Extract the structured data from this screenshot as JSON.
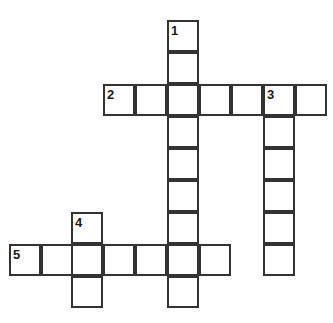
{
  "puzzle": {
    "type": "crossword-grid",
    "title": "",
    "background_color": "#fefefe",
    "cell_fill_color": "#ffffff",
    "line_color": "#333333",
    "number_color": "#1a1a1a",
    "cell_size": 32,
    "border_width": 2,
    "grid_origin": {
      "x": 9,
      "y": 20
    },
    "canvas": {
      "width": 333,
      "height": 323
    },
    "entries": [
      {
        "number": "1",
        "direction": "down",
        "length": 9,
        "start_col": 5,
        "start_row": 0,
        "start_x": 167,
        "start_y": 20
      },
      {
        "number": "2",
        "direction": "across",
        "length": 7,
        "start_col": 3,
        "start_row": 2,
        "start_x": 103,
        "start_y": 84
      },
      {
        "number": "3",
        "direction": "down",
        "length": 6,
        "start_col": 8,
        "start_row": 2,
        "start_x": 263,
        "start_y": 84
      },
      {
        "number": "4",
        "direction": "down",
        "length": 3,
        "start_col": 2,
        "start_row": 6,
        "start_x": 71,
        "start_y": 212
      },
      {
        "number": "5",
        "direction": "across",
        "length": 7,
        "start_col": 0,
        "start_row": 7,
        "start_x": 9,
        "start_y": 244
      }
    ],
    "cells": [
      {
        "id": "c-r0-c5",
        "x": 167,
        "y": 20,
        "letter": "",
        "number": "1"
      },
      {
        "id": "c-r1-c5",
        "x": 167,
        "y": 52,
        "letter": "",
        "number": ""
      },
      {
        "id": "c-r2-c3",
        "x": 103,
        "y": 84,
        "letter": "",
        "number": "2"
      },
      {
        "id": "c-r2-c4",
        "x": 135,
        "y": 84,
        "letter": "",
        "number": ""
      },
      {
        "id": "c-r2-c5",
        "x": 167,
        "y": 84,
        "letter": "",
        "number": ""
      },
      {
        "id": "c-r2-c6",
        "x": 199,
        "y": 84,
        "letter": "",
        "number": ""
      },
      {
        "id": "c-r2-c7",
        "x": 231,
        "y": 84,
        "letter": "",
        "number": ""
      },
      {
        "id": "c-r2-c8",
        "x": 263,
        "y": 84,
        "letter": "",
        "number": "3"
      },
      {
        "id": "c-r2-c9",
        "x": 295,
        "y": 84,
        "letter": "",
        "number": ""
      },
      {
        "id": "c-r3-c5",
        "x": 167,
        "y": 116,
        "letter": "",
        "number": ""
      },
      {
        "id": "c-r3-c8",
        "x": 263,
        "y": 116,
        "letter": "",
        "number": ""
      },
      {
        "id": "c-r4-c5",
        "x": 167,
        "y": 148,
        "letter": "",
        "number": ""
      },
      {
        "id": "c-r4-c8",
        "x": 263,
        "y": 148,
        "letter": "",
        "number": ""
      },
      {
        "id": "c-r5-c5",
        "x": 167,
        "y": 180,
        "letter": "",
        "number": ""
      },
      {
        "id": "c-r5-c8",
        "x": 263,
        "y": 180,
        "letter": "",
        "number": ""
      },
      {
        "id": "c-r6-c2",
        "x": 71,
        "y": 212,
        "letter": "",
        "number": "4"
      },
      {
        "id": "c-r6-c5",
        "x": 167,
        "y": 212,
        "letter": "",
        "number": ""
      },
      {
        "id": "c-r6-c8",
        "x": 263,
        "y": 212,
        "letter": "",
        "number": ""
      },
      {
        "id": "c-r7-c0",
        "x": 9,
        "y": 244,
        "letter": "",
        "number": "5"
      },
      {
        "id": "c-r7-c1",
        "x": 41,
        "y": 244,
        "letter": "",
        "number": ""
      },
      {
        "id": "c-r7-c2",
        "x": 71,
        "y": 244,
        "letter": "",
        "number": ""
      },
      {
        "id": "c-r7-c3",
        "x": 103,
        "y": 244,
        "letter": "",
        "number": ""
      },
      {
        "id": "c-r7-c4",
        "x": 135,
        "y": 244,
        "letter": "",
        "number": ""
      },
      {
        "id": "c-r7-c5",
        "x": 167,
        "y": 244,
        "letter": "",
        "number": ""
      },
      {
        "id": "c-r7-c6",
        "x": 199,
        "y": 244,
        "letter": "",
        "number": ""
      },
      {
        "id": "c-r7-c8",
        "x": 263,
        "y": 244,
        "letter": "",
        "number": ""
      },
      {
        "id": "c-r8-c2",
        "x": 71,
        "y": 276,
        "letter": "",
        "number": ""
      },
      {
        "id": "c-r8-c5",
        "x": 167,
        "y": 276,
        "letter": "",
        "number": ""
      }
    ],
    "numbers": [
      {
        "label": "1",
        "x": 171,
        "y": 24
      },
      {
        "label": "2",
        "x": 107,
        "y": 88
      },
      {
        "label": "3",
        "x": 267,
        "y": 88
      },
      {
        "label": "4",
        "x": 75,
        "y": 216
      },
      {
        "label": "5",
        "x": 13,
        "y": 248
      }
    ]
  }
}
